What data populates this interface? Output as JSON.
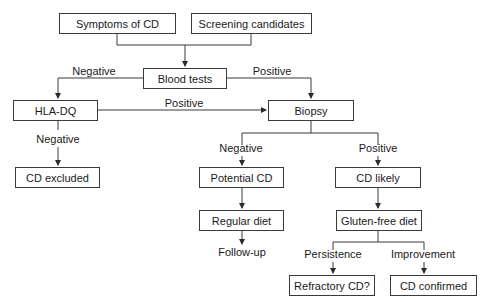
{
  "diagram": {
    "nodes": {
      "symptoms": "Symptoms of CD",
      "screening": "Screening candidates",
      "blood_tests": "Blood tests",
      "hla_dq": "HLA-DQ",
      "biopsy": "Biopsy",
      "cd_excluded": "CD excluded",
      "potential_cd": "Potential CD",
      "cd_likely": "CD likely",
      "regular_diet": "Regular diet",
      "gluten_free_diet": "Gluten-free diet",
      "follow_up": "Follow-up",
      "refractory_cd": "Refractory CD?",
      "cd_confirmed": "CD confirmed"
    },
    "edge_labels": {
      "blood_negative": "Negative",
      "blood_positive": "Positive",
      "hla_positive": "Positive",
      "hla_negative": "Negative",
      "biopsy_negative": "Negative",
      "biopsy_positive": "Positive",
      "persistence": "Persistence",
      "improvement": "Improvement"
    },
    "edges": [
      [
        "Symptoms of CD",
        "Blood tests"
      ],
      [
        "Screening candidates",
        "Blood tests"
      ],
      [
        "Blood tests",
        "HLA-DQ",
        "Negative"
      ],
      [
        "Blood tests",
        "Biopsy",
        "Positive"
      ],
      [
        "HLA-DQ",
        "Biopsy",
        "Positive"
      ],
      [
        "HLA-DQ",
        "CD excluded",
        "Negative"
      ],
      [
        "Biopsy",
        "Potential CD",
        "Negative"
      ],
      [
        "Biopsy",
        "CD likely",
        "Positive"
      ],
      [
        "Potential CD",
        "Regular diet"
      ],
      [
        "Regular diet",
        "Follow-up"
      ],
      [
        "CD likely",
        "Gluten-free diet"
      ],
      [
        "Gluten-free diet",
        "Refractory CD?",
        "Persistence"
      ],
      [
        "Gluten-free diet",
        "CD confirmed",
        "Improvement"
      ]
    ]
  }
}
